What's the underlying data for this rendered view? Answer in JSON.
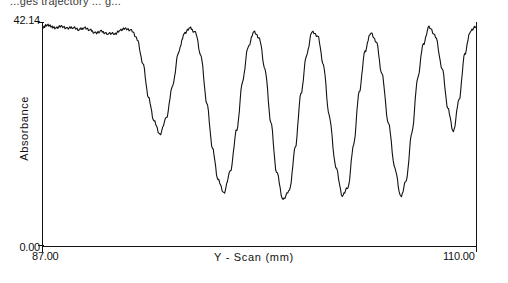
{
  "caption": {
    "clipped_top_text": "...ges trajectory ... g..."
  },
  "axes": {
    "y_title": "Absorbance",
    "y_tick_top": "42.14",
    "y_tick_bottom": "0.00",
    "x_title": "Y - Scan (mm)",
    "x_tick_left": "87.00",
    "x_tick_right": "110.00"
  },
  "chart_data": {
    "type": "line",
    "title": "",
    "xlabel": "Y - Scan (mm)",
    "ylabel": "Absorbance",
    "xlim": [
      87.0,
      110.0
    ],
    "ylim": [
      0.0,
      42.14
    ],
    "grid": false,
    "legend": null,
    "line_color": "#111111",
    "series": [
      {
        "name": "Absorbance scan",
        "x": [
          87.0,
          87.2,
          87.45,
          87.7,
          88.0,
          88.3,
          88.6,
          88.9,
          89.2,
          89.5,
          89.8,
          90.1,
          90.45,
          90.8,
          91.1,
          91.4,
          91.7,
          92.0,
          92.3,
          92.6,
          92.9,
          93.2,
          93.55,
          93.9,
          94.2,
          94.5,
          94.8,
          95.1,
          95.4,
          95.7,
          96.0,
          96.3,
          96.6,
          96.95,
          97.3,
          97.6,
          97.9,
          98.2,
          98.5,
          98.8,
          99.1,
          99.4,
          99.75,
          100.1,
          100.4,
          100.7,
          101.0,
          101.3,
          101.6,
          101.9,
          102.2,
          102.55,
          102.9,
          103.2,
          103.5,
          103.8,
          104.1,
          104.4,
          104.7,
          105.0,
          105.35,
          105.7,
          106.0,
          106.3,
          106.6,
          106.9,
          107.2,
          107.5,
          107.85,
          108.2,
          108.5,
          108.8,
          109.1,
          109.4,
          109.7,
          110.0
        ],
        "y": [
          41.2,
          41.6,
          41.3,
          41.0,
          41.35,
          40.9,
          41.2,
          40.7,
          41.1,
          40.6,
          40.1,
          40.35,
          40.0,
          39.95,
          40.6,
          40.95,
          40.55,
          39.0,
          34.5,
          28.0,
          23.5,
          21.0,
          24.0,
          30.5,
          36.5,
          40.0,
          41.0,
          40.2,
          35.5,
          27.0,
          18.5,
          12.5,
          10.0,
          14.0,
          22.0,
          31.0,
          37.5,
          40.3,
          39.0,
          33.0,
          23.5,
          14.0,
          8.8,
          10.5,
          18.5,
          28.5,
          36.0,
          40.4,
          39.5,
          34.0,
          24.5,
          15.0,
          9.5,
          11.0,
          19.0,
          29.0,
          36.5,
          40.2,
          38.5,
          32.5,
          23.0,
          14.5,
          9.2,
          12.5,
          21.5,
          31.5,
          38.0,
          41.2,
          39.5,
          33.5,
          26.0,
          21.5,
          27.5,
          36.0,
          40.5,
          41.3
        ]
      }
    ]
  }
}
